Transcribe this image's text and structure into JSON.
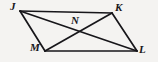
{
  "figure": {
    "kind": "geometry-diagram",
    "shape": "parallelogram",
    "name": "JKLM",
    "background_color": "#f4f3f1",
    "stroke_color": "#17161a",
    "stroke_width": 1.7,
    "labels": {
      "j": "J",
      "k": "K",
      "n": "N",
      "m": "M",
      "l": "L"
    },
    "points": {
      "J": {
        "x": 20,
        "y": 11
      },
      "K": {
        "x": 112,
        "y": 13
      },
      "L": {
        "x": 137,
        "y": 51
      },
      "M": {
        "x": 45,
        "y": 51
      },
      "N": {
        "x": 77,
        "y": 30
      }
    },
    "segments": [
      {
        "id": "JK",
        "from": "J",
        "to": "K",
        "role": "side"
      },
      {
        "id": "KL",
        "from": "K",
        "to": "L",
        "role": "side"
      },
      {
        "id": "LM",
        "from": "L",
        "to": "M",
        "role": "side"
      },
      {
        "id": "MJ",
        "from": "M",
        "to": "J",
        "role": "side"
      },
      {
        "id": "JL",
        "from": "J",
        "to": "L",
        "role": "diagonal"
      },
      {
        "id": "KM",
        "from": "K",
        "to": "M",
        "role": "diagonal"
      }
    ]
  }
}
